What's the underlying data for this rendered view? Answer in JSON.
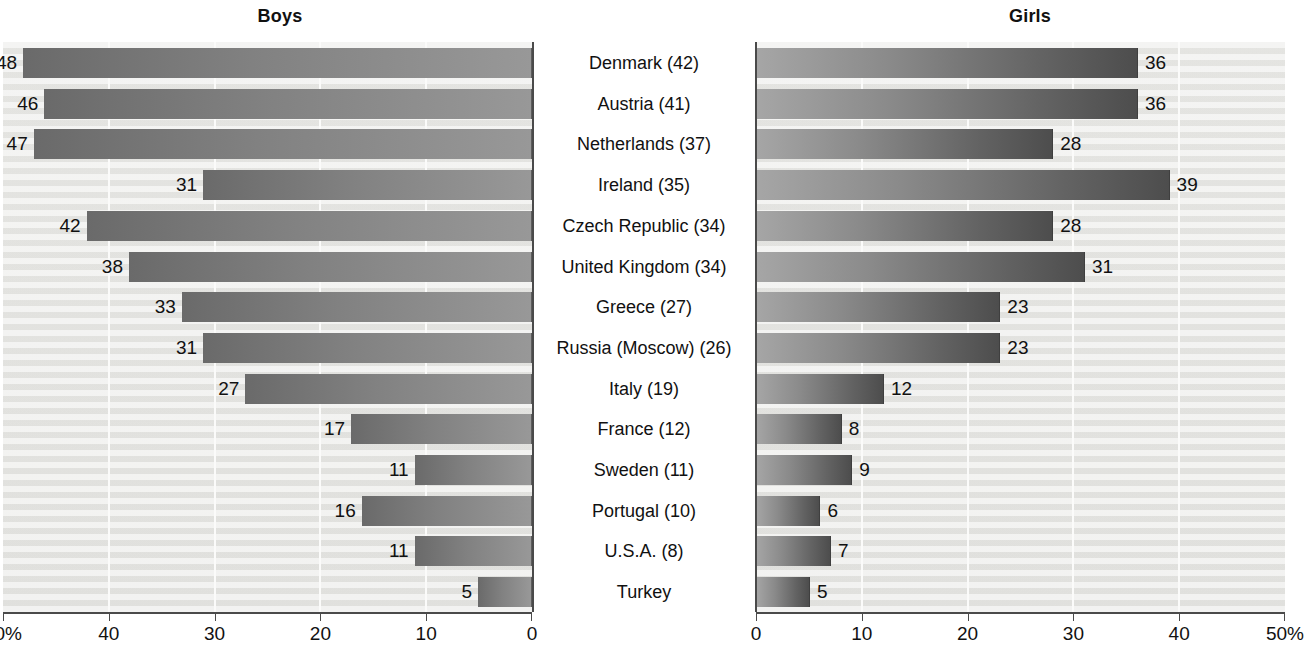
{
  "figure": {
    "left_panel_title": "Boys",
    "right_panel_title": "Girls"
  },
  "chart_data": {
    "type": "bar",
    "title": "",
    "orientation": "horizontal",
    "layout": "back-to-back / bidirectional paired bar chart",
    "panels": [
      {
        "name": "Boys",
        "direction": "right-to-left",
        "axis": {
          "xlabel": "",
          "ticks": [
            50,
            40,
            30,
            20,
            10,
            0
          ],
          "tick_labels": [
            "50%",
            "40",
            "30",
            "20",
            "10",
            "0"
          ],
          "xlim": [
            50,
            0
          ],
          "unit": "%"
        }
      },
      {
        "name": "Girls",
        "direction": "left-to-right",
        "axis": {
          "xlabel": "",
          "ticks": [
            0,
            10,
            20,
            30,
            40,
            50
          ],
          "tick_labels": [
            "0",
            "10",
            "20",
            "30",
            "40",
            "50%"
          ],
          "xlim": [
            0,
            50
          ],
          "unit": "%"
        }
      }
    ],
    "categories": [
      "Denmark (42)",
      "Austria (41)",
      "Netherlands (37)",
      "Ireland (35)",
      "Czech Republic (34)",
      "United Kingdom (34)",
      "Greece (27)",
      "Russia (Moscow) (26)",
      "Italy (19)",
      "France (12)",
      "Sweden (11)",
      "Portugal (10)",
      "U.S.A. (8)",
      "Turkey"
    ],
    "series": [
      {
        "name": "Boys",
        "values": [
          48,
          46,
          47,
          31,
          42,
          38,
          33,
          31,
          27,
          17,
          11,
          16,
          11,
          5
        ]
      },
      {
        "name": "Girls",
        "values": [
          36,
          36,
          28,
          39,
          28,
          31,
          23,
          23,
          12,
          8,
          9,
          6,
          7,
          5
        ]
      }
    ],
    "grid": true,
    "legend": "none"
  }
}
